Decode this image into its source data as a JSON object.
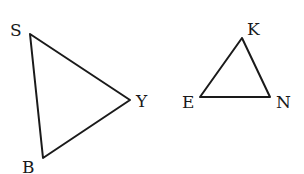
{
  "triangles": [
    {
      "name": "SYB",
      "vertices": [
        {
          "label": "S",
          "x": 30,
          "y": 34,
          "lx": 10,
          "ly": 36
        },
        {
          "label": "Y",
          "x": 130,
          "y": 100,
          "lx": 136,
          "ly": 107
        },
        {
          "label": "B",
          "x": 43,
          "y": 158,
          "lx": 22,
          "ly": 173
        }
      ]
    },
    {
      "name": "KEN",
      "vertices": [
        {
          "label": "K",
          "x": 242,
          "y": 38,
          "lx": 247,
          "ly": 35
        },
        {
          "label": "E",
          "x": 200,
          "y": 97,
          "lx": 182,
          "ly": 108
        },
        {
          "label": "N",
          "x": 270,
          "y": 97,
          "lx": 276,
          "ly": 108
        }
      ]
    }
  ],
  "stroke_color": "#1a1a1a"
}
